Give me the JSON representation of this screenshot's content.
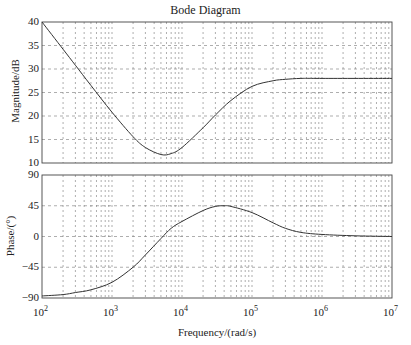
{
  "title": "Bode Diagram",
  "chart_data": [
    {
      "type": "line",
      "title": "Bode Diagram",
      "xlabel": "Frequency/(rad/s)",
      "ylabel": "Magnitude/dB",
      "xscale": "log",
      "xlim": [
        100,
        10000000
      ],
      "ylim": [
        10,
        40
      ],
      "yticks": [
        10,
        15,
        20,
        25,
        30,
        35,
        40
      ],
      "grid": true,
      "x": [
        100,
        200,
        300,
        500,
        1000,
        2000,
        3000,
        5000,
        7000,
        10000,
        20000,
        30000,
        50000,
        100000,
        200000,
        300000,
        500000,
        1000000,
        10000000
      ],
      "series": [
        {
          "name": "Magnitude",
          "values": [
            40,
            34.2,
            30.8,
            26.5,
            20.8,
            15.6,
            13.3,
            11.8,
            12.0,
            13.3,
            17.5,
            20.2,
            23.3,
            26.3,
            27.5,
            27.8,
            28.0,
            28.0,
            28.0
          ]
        }
      ]
    },
    {
      "type": "line",
      "xlabel": "Frequency/(rad/s)",
      "ylabel": "Phase/(°)",
      "xscale": "log",
      "xlim": [
        100,
        10000000
      ],
      "ylim": [
        -90,
        90
      ],
      "yticks": [
        -90,
        -45,
        0,
        45,
        90
      ],
      "grid": true,
      "x": [
        100,
        200,
        300,
        500,
        1000,
        2000,
        3000,
        5000,
        7000,
        10000,
        20000,
        30000,
        40000,
        50000,
        100000,
        200000,
        300000,
        500000,
        1000000,
        3000000,
        10000000
      ],
      "series": [
        {
          "name": "Phase",
          "values": [
            -87,
            -85,
            -82,
            -78,
            -67,
            -45,
            -27,
            -3,
            12,
            22,
            38,
            44,
            45,
            44,
            35,
            20,
            12,
            6,
            3,
            1,
            0
          ]
        }
      ]
    }
  ],
  "axes": {
    "mag_yticks": [
      "40",
      "35",
      "30",
      "25",
      "20",
      "15",
      "10"
    ],
    "phase_yticks": [
      "90",
      "45",
      "0",
      "-45",
      "-90"
    ],
    "xticks": [
      "10",
      "10",
      "10",
      "10",
      "10",
      "10"
    ],
    "xtick_exps": [
      "2",
      "3",
      "4",
      "5",
      "6",
      "7"
    ],
    "mag_ylabel": "Magnitude/dB",
    "phase_ylabel": "Phase/(°)",
    "xlabel": "Frequency/(rad/s)"
  }
}
